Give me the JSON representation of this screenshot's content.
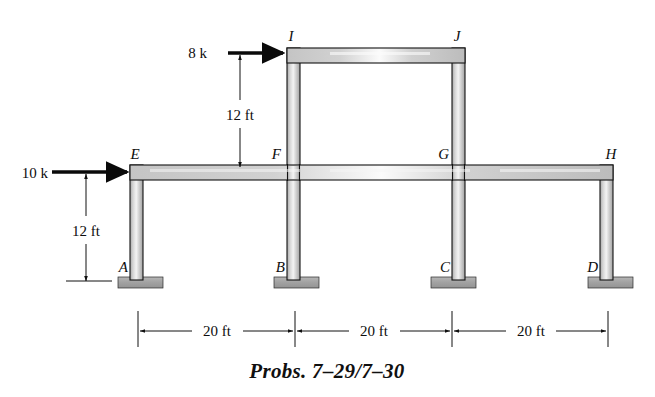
{
  "figure": {
    "caption": "Probs. 7–29/7–30",
    "type": "structural-frame-diagram",
    "colors": {
      "member_light": "#f2f2f2",
      "member_mid": "#c9c9c9",
      "member_dark": "#9a9a9a",
      "outline": "#111111",
      "support_fill": "#9e9e9e",
      "background": "#ffffff",
      "text": "#0d0d0d"
    },
    "joint_labels": [
      {
        "name": "A",
        "text": "A",
        "x": 122,
        "y": 268,
        "anchor": "end"
      },
      {
        "name": "B",
        "text": "B",
        "x": 282,
        "y": 268,
        "anchor": "end"
      },
      {
        "name": "C",
        "text": "C",
        "x": 439,
        "y": 268,
        "anchor": "end"
      },
      {
        "name": "D",
        "text": "D",
        "x": 595,
        "y": 268,
        "anchor": "end"
      },
      {
        "name": "E",
        "text": "E",
        "x": 135,
        "y": 158,
        "anchor": "middle"
      },
      {
        "name": "F",
        "text": "F",
        "x": 279,
        "y": 158,
        "anchor": "end"
      },
      {
        "name": "G",
        "text": "G",
        "x": 447,
        "y": 158,
        "anchor": "end"
      },
      {
        "name": "H",
        "text": "H",
        "x": 612,
        "y": 158,
        "anchor": "middle"
      },
      {
        "name": "I",
        "text": "I",
        "x": 290,
        "y": 40,
        "anchor": "middle"
      },
      {
        "name": "J",
        "text": "J",
        "x": 456,
        "y": 40,
        "anchor": "middle"
      }
    ],
    "loads": [
      {
        "name": "lateral-load-upper",
        "label": "8 k",
        "magnitude": 8,
        "unit": "k",
        "applied_at": "I",
        "direction": "right",
        "label_x": 207,
        "label_y": 58,
        "shaft_x1": 228,
        "shaft_x2": 282,
        "shaft_y": 53
      },
      {
        "name": "lateral-load-lower",
        "label": "10 k",
        "magnitude": 10,
        "unit": "k",
        "applied_at": "E",
        "direction": "right",
        "label_x": 12,
        "label_y": 178,
        "shaft_x1": 50,
        "shaft_x2": 126,
        "shaft_y": 172
      }
    ],
    "vertical_dimensions": [
      {
        "name": "story-height-upper",
        "label": "12 ft",
        "value": 12,
        "unit": "ft",
        "from": "I",
        "to": "F",
        "line_x": 240,
        "y_top": 53,
        "y_bottom": 168,
        "label_x": 240,
        "label_y": 116
      },
      {
        "name": "story-height-lower",
        "label": "12 ft",
        "value": 12,
        "unit": "ft",
        "from": "E",
        "to": "A",
        "line_x": 86,
        "y_top": 172,
        "y_bottom": 284,
        "label_x": 86,
        "label_y": 232
      }
    ],
    "horizontal_dimensions": [
      {
        "name": "bay-1-span",
        "label": "20 ft",
        "value": 20,
        "unit": "ft",
        "from": "A",
        "to": "B",
        "x1": 138,
        "x2": 295,
        "label_x": 216
      },
      {
        "name": "bay-2-span",
        "label": "20 ft",
        "value": 20,
        "unit": "ft",
        "from": "B",
        "to": "C",
        "x1": 295,
        "x2": 452,
        "label_x": 373
      },
      {
        "name": "bay-3-span",
        "label": "20 ft",
        "value": 20,
        "unit": "ft",
        "from": "C",
        "to": "D",
        "x1": 452,
        "x2": 608,
        "label_x": 530
      }
    ],
    "dimension_chain": {
      "baseline_y": 331,
      "tick_top": 311,
      "tick_bottom": 347,
      "ticks": [
        138,
        295,
        452,
        608
      ]
    },
    "supports": [
      {
        "name": "support-A",
        "joint": "A",
        "kind": "fixed",
        "x": 118,
        "y": 277,
        "width": 45,
        "height": 11
      },
      {
        "name": "support-B",
        "joint": "B",
        "kind": "fixed",
        "x": 274,
        "y": 277,
        "width": 45,
        "height": 11
      },
      {
        "name": "support-C",
        "joint": "C",
        "kind": "fixed",
        "x": 431,
        "y": 277,
        "width": 45,
        "height": 11
      },
      {
        "name": "support-D",
        "joint": "D",
        "kind": "fixed",
        "x": 588,
        "y": 277,
        "width": 45,
        "height": 11
      }
    ],
    "members": {
      "beam_thickness": 15,
      "column_thickness": 13,
      "lower_beam": {
        "name": "beam-E-H",
        "x1": 130,
        "x2": 613,
        "y_top": 165,
        "y_bottom": 180
      },
      "upper_beam": {
        "name": "beam-I-J",
        "x1": 287,
        "x2": 465,
        "y_top": 48,
        "y_bottom": 63
      },
      "columns": [
        {
          "name": "column-A-E",
          "x_left": 130,
          "x_right": 143,
          "y_top": 165,
          "y_bottom": 280
        },
        {
          "name": "column-B-I",
          "x_left": 287,
          "x_right": 300,
          "y_top": 48,
          "y_bottom": 280
        },
        {
          "name": "column-C-J",
          "x_left": 452,
          "x_right": 465,
          "y_top": 48,
          "y_bottom": 280
        },
        {
          "name": "column-D-H",
          "x_left": 600,
          "x_right": 613,
          "y_top": 165,
          "y_bottom": 280
        }
      ]
    }
  }
}
